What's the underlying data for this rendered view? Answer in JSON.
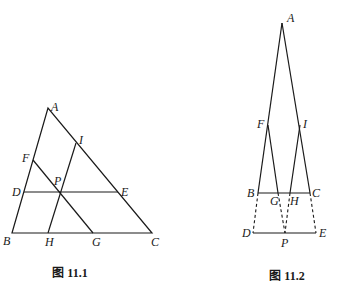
{
  "figures": [
    {
      "caption": "图 11.1",
      "points": {
        "A": {
          "label": "A",
          "x": 48,
          "y": 108
        },
        "B": {
          "label": "B",
          "x": 12,
          "y": 233
        },
        "C": {
          "label": "C",
          "x": 152,
          "y": 233
        },
        "D": {
          "label": "D",
          "x": 24,
          "y": 192
        },
        "E": {
          "label": "E",
          "x": 118,
          "y": 192
        },
        "F": {
          "label": "F",
          "x": 33,
          "y": 160
        },
        "I": {
          "label": "I",
          "x": 76,
          "y": 143
        },
        "P": {
          "label": "P",
          "x": 60,
          "y": 192
        },
        "H": {
          "label": "H",
          "x": 48,
          "y": 233
        },
        "G": {
          "label": "G",
          "x": 93,
          "y": 233
        }
      },
      "segments": [
        [
          "A",
          "B"
        ],
        [
          "A",
          "C"
        ],
        [
          "B",
          "C"
        ],
        [
          "D",
          "E"
        ],
        [
          "F",
          "G"
        ],
        [
          "I",
          "H"
        ]
      ]
    },
    {
      "caption": "图 11.2",
      "points": {
        "A": {
          "label": "A",
          "x": 282,
          "y": 23
        },
        "F": {
          "label": "F",
          "x": 268,
          "y": 125
        },
        "I": {
          "label": "I",
          "x": 300,
          "y": 125
        },
        "B": {
          "label": "B",
          "x": 258,
          "y": 193
        },
        "C": {
          "label": "C",
          "x": 310,
          "y": 193
        },
        "G": {
          "label": "G",
          "x": 278,
          "y": 193
        },
        "H": {
          "label": "H",
          "x": 290,
          "y": 193
        },
        "D": {
          "label": "D",
          "x": 253,
          "y": 233
        },
        "P": {
          "label": "P",
          "x": 285,
          "y": 233
        },
        "E": {
          "label": "E",
          "x": 316,
          "y": 233
        }
      },
      "solid_segments": [
        [
          "A",
          "B"
        ],
        [
          "A",
          "C"
        ],
        [
          "B",
          "C"
        ],
        [
          "F",
          "G"
        ],
        [
          "I",
          "H"
        ],
        [
          "D",
          "E"
        ]
      ],
      "dashed_segments": [
        [
          "B",
          "D"
        ],
        [
          "C",
          "E"
        ],
        [
          "G",
          "P"
        ],
        [
          "H",
          "P"
        ]
      ]
    }
  ]
}
